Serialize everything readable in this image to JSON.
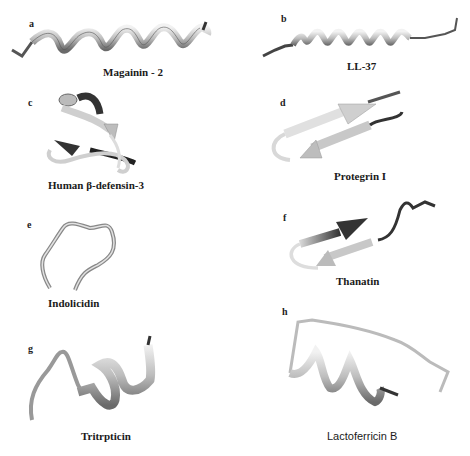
{
  "figure": {
    "panels": [
      {
        "letter": "a",
        "name": "Magainin - 2",
        "structure": "alpha-helix"
      },
      {
        "letter": "b",
        "name": "LL-37",
        "structure": "alpha-helix"
      },
      {
        "letter": "c",
        "name": "Human β-defensin-3",
        "structure": "beta-sheet with helix"
      },
      {
        "letter": "d",
        "name": "Protegrin I",
        "structure": "beta-hairpin"
      },
      {
        "letter": "e",
        "name": "Indolicidin",
        "structure": "extended coil"
      },
      {
        "letter": "f",
        "name": "Thanatin",
        "structure": "beta-hairpin"
      },
      {
        "letter": "g",
        "name": "Tritrpticin",
        "structure": "coil with helical turn"
      },
      {
        "letter": "h",
        "name": "Lactoferricin B",
        "structure": "helix with loop"
      }
    ],
    "colors": {
      "ribbon_light": "#e6e6e6",
      "ribbon_mid": "#a8a8a8",
      "ribbon_dark": "#4a4a4a",
      "text": "#1a1a1a"
    }
  }
}
